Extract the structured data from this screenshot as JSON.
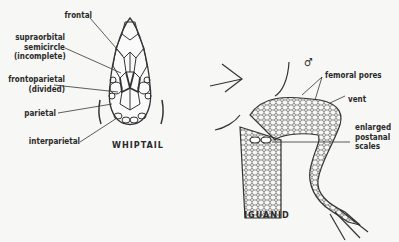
{
  "figures": [
    {
      "caption": "WHIPTAIL",
      "labels": {
        "frontal": "frontal",
        "supraorbital_1": "supraorbital",
        "supraorbital_2": "semicircle",
        "supraorbital_3": "(incomplete)",
        "frontoparietal_1": "frontoparietal",
        "frontoparietal_2": "(divided)",
        "parietal": "parietal",
        "interparietal": "interparietal"
      }
    },
    {
      "caption": "IGUANID",
      "sex_symbol": "♂",
      "labels": {
        "femoral_pores": "femoral pores",
        "vent": "vent",
        "postanal_1": "enlarged",
        "postanal_2": "postanal",
        "postanal_3": "scales"
      }
    }
  ]
}
